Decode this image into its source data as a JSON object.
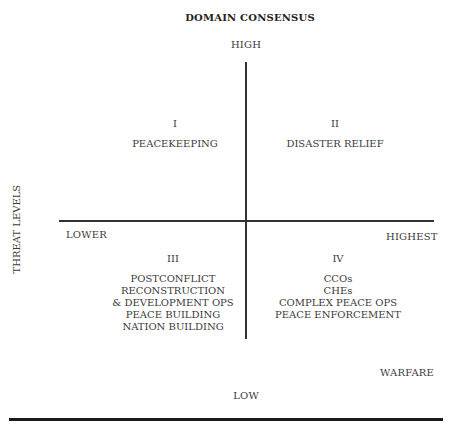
{
  "title": "DOMAIN CONSENSUS",
  "axes": {
    "y_axis_label": "THREAT LEVELS",
    "top": "HIGH",
    "bottom": "LOW",
    "left": "LOWER",
    "right": "HIGHEST"
  },
  "quadrants": [
    {
      "numeral": "I",
      "items": [
        "PEACEKEEPING"
      ]
    },
    {
      "numeral": "II",
      "items": [
        "DISASTER RELIEF"
      ]
    },
    {
      "numeral": "III",
      "items": [
        "POSTCONFLICT",
        "RECONSTRUCTION",
        "& DEVELOPMENT OPS",
        "PEACE BUILDING",
        "NATION BUILDING"
      ]
    },
    {
      "numeral": "IV",
      "items": [
        "CCOs",
        "CHEs",
        "COMPLEX PEACE OPS",
        "PEACE ENFORCEMENT"
      ]
    }
  ],
  "corner_label": "WARFARE"
}
